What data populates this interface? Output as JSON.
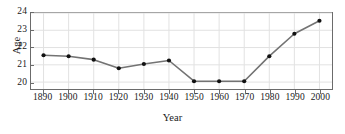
{
  "chart_data": {
    "type": "line",
    "title": "",
    "xlabel": "Year",
    "ylabel": "Age",
    "x": [
      1890,
      1900,
      1910,
      1920,
      1930,
      1940,
      1950,
      1960,
      1970,
      1980,
      1990,
      2000
    ],
    "values": [
      21.55,
      21.5,
      21.3,
      20.8,
      21.05,
      21.25,
      20.05,
      20.05,
      20.05,
      21.5,
      22.8,
      23.55
    ],
    "series": [
      {
        "name": "Age",
        "values": [
          21.55,
          21.5,
          21.3,
          20.8,
          21.05,
          21.25,
          20.05,
          20.05,
          20.05,
          21.5,
          22.8,
          23.55
        ]
      }
    ],
    "xtick_labels": [
      "1890",
      "1900",
      "1910",
      "1920",
      "1930",
      "1940",
      "1950",
      "1960",
      "1970",
      "1980",
      "1990",
      "2000"
    ],
    "ytick_labels": [
      "20",
      "21",
      "22",
      "23",
      "24"
    ],
    "yticks": [
      20,
      21,
      22,
      23,
      24
    ],
    "xlim": [
      1885,
      2005
    ],
    "ylim": [
      19.6,
      24.0
    ],
    "grid": true,
    "grid_axis": "both",
    "legend": false,
    "legend_position": "none",
    "marker": "circle",
    "line_color": "#737373",
    "marker_color": "#111111",
    "grid_color": "#e2e2e2",
    "frame_color": "#6b6b6b",
    "text_color": "#1a1a1a"
  }
}
